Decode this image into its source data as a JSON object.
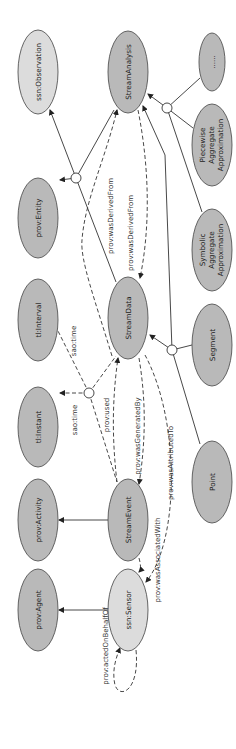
{
  "diagram": {
    "orientation": "rotated-90-ccw",
    "colors": {
      "node_dark": "#b9b9b9",
      "node_light": "#dcdcdc",
      "stroke": "#333333",
      "background": "#ffffff"
    },
    "nodes": {
      "ssn_observation": {
        "label": "ssn:Observation"
      },
      "prov_entity": {
        "label": "prov:Entity"
      },
      "tl_interval": {
        "label": "tl:Interval"
      },
      "tl_instant": {
        "label": "tl:Instant"
      },
      "prov_activity": {
        "label": "prov:Activity"
      },
      "prov_agent": {
        "label": "prov:Agent"
      },
      "stream_analysis": {
        "label": "StreamAnalysis"
      },
      "stream_data": {
        "label": "StreamData"
      },
      "stream_event": {
        "label": "StreamEvent"
      },
      "ssn_sensor": {
        "label": "ssn:Sensor"
      },
      "ellipsis": {
        "label": "......"
      },
      "paa": {
        "lines": [
          "Piecewise",
          "Aggregate",
          "Approximation"
        ]
      },
      "sax": {
        "lines": [
          "Symbolic",
          "Aggregate",
          "Approximation"
        ]
      },
      "segment": {
        "label": "Segment"
      },
      "point": {
        "label": "Point"
      }
    },
    "edges": {
      "derived1": "prov:wasDerivedFrom",
      "derived2": "prov:wasDerivedFrom",
      "sao_time_interval": "sao:time",
      "sao_time_instant": "sao:time",
      "used": "prov:used",
      "generated_by": "prov:wasGeneratedBy",
      "attributed_to": "prov:wasAttributedTo",
      "associated_with": "prov:wasAssociatedWith",
      "acted_on_behalf_of": "prov:actedOnBehalfOf"
    }
  }
}
